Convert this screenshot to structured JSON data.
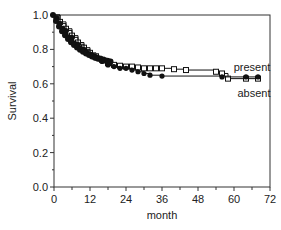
{
  "chart_data": {
    "type": "line",
    "title": "",
    "xlabel": "month",
    "ylabel": "Survival",
    "xlim": [
      0,
      72
    ],
    "ylim": [
      0.0,
      1.0
    ],
    "xticks": [
      0,
      12,
      24,
      36,
      48,
      60,
      72
    ],
    "yticks": [
      0.0,
      0.2,
      0.4,
      0.6,
      0.8,
      1.0
    ],
    "grid": false,
    "legend_position": "inline-right",
    "series": [
      {
        "name": "present",
        "marker": "open-square",
        "x": [
          0,
          2,
          4,
          6,
          8,
          10,
          12,
          14,
          16,
          18,
          20,
          22,
          24,
          26,
          28,
          30,
          32,
          34,
          36,
          40,
          44,
          54,
          56,
          58,
          64,
          68
        ],
        "y": [
          1.0,
          0.96,
          0.92,
          0.88,
          0.84,
          0.81,
          0.78,
          0.76,
          0.74,
          0.72,
          0.71,
          0.705,
          0.7,
          0.7,
          0.695,
          0.69,
          0.69,
          0.69,
          0.69,
          0.685,
          0.68,
          0.67,
          0.66,
          0.63,
          0.63,
          0.63
        ]
      },
      {
        "name": "absent",
        "marker": "filled-circle",
        "x": [
          0,
          2,
          4,
          6,
          8,
          10,
          12,
          14,
          16,
          18,
          20,
          22,
          24,
          26,
          28,
          30,
          32,
          36,
          56,
          64,
          68
        ],
        "y": [
          1.0,
          0.95,
          0.91,
          0.87,
          0.83,
          0.8,
          0.77,
          0.75,
          0.73,
          0.71,
          0.7,
          0.69,
          0.69,
          0.68,
          0.67,
          0.66,
          0.65,
          0.645,
          0.64,
          0.64,
          0.64
        ]
      }
    ],
    "annotations": [
      {
        "text": "present",
        "x": 66,
        "y": 0.69
      },
      {
        "text": "absent",
        "x": 66,
        "y": 0.55
      }
    ]
  },
  "labels": {
    "ylabel": "Survival",
    "xlabel": "month",
    "present": "present",
    "absent": "absent",
    "xticks": [
      "0",
      "12",
      "24",
      "36",
      "48",
      "60",
      "72"
    ],
    "yticks": [
      "0.0",
      "0.2",
      "0.4",
      "0.6",
      "0.8",
      "1.0"
    ]
  }
}
